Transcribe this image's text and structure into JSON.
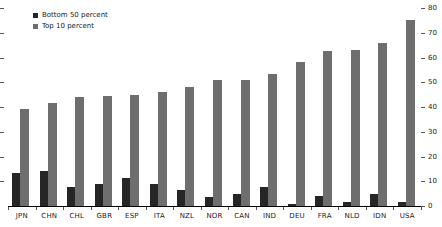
{
  "chart_data": {
    "type": "bar",
    "title": "",
    "xlabel": "",
    "ylabel": "",
    "categories": [
      "JPN",
      "CHN",
      "CHL",
      "GBR",
      "ESP",
      "ITA",
      "NZL",
      "NOR",
      "CAN",
      "IND",
      "DEU",
      "FRA",
      "NLD",
      "IDN",
      "USA"
    ],
    "series": [
      {
        "name": "Bottom 50 percent",
        "color": "#262626",
        "values": [
          13.5,
          14,
          7.5,
          9,
          11.5,
          9,
          6.5,
          3.5,
          5,
          7.5,
          1,
          4,
          1.5,
          5,
          1.5
        ]
      },
      {
        "name": "Top 10 percent",
        "color": "#6e6e6e",
        "values": [
          39,
          41.5,
          44,
          44.5,
          45,
          46,
          48,
          51,
          51,
          53.5,
          58,
          62.5,
          63,
          66,
          75
        ]
      }
    ],
    "ylim": [
      0,
      80
    ],
    "yticks": [
      0,
      10,
      20,
      30,
      40,
      50,
      60,
      70,
      80
    ],
    "y_axis_side": "right",
    "grid": false,
    "legend_position": "top-left"
  },
  "colors": {
    "background": "#ffffff",
    "axis": "#000000",
    "tick_text": "#1a1a1a"
  }
}
